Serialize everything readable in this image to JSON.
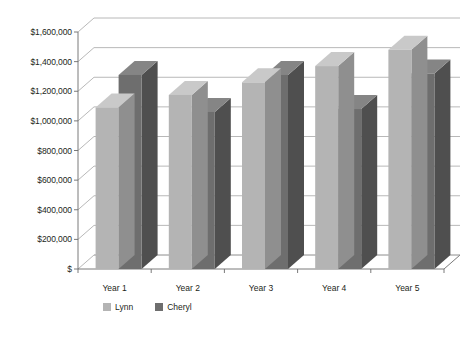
{
  "chart_data": {
    "type": "bar",
    "title": "",
    "subtitle": "",
    "xlabel": "",
    "ylabel": "",
    "categories": [
      "Year 1",
      "Year 2",
      "Year 3",
      "Year 4",
      "Year 5"
    ],
    "series": [
      {
        "name": "Lynn",
        "color": "#b4b4b4",
        "values": [
          1090000,
          1175000,
          1260000,
          1370000,
          1480000
        ]
      },
      {
        "name": "Cheryl",
        "color": "#6e6e6e",
        "values": [
          1310000,
          1060000,
          1310000,
          1080000,
          1320000
        ]
      }
    ],
    "ylim": [
      0,
      1600000
    ],
    "ytick_values": [
      0,
      200000,
      400000,
      600000,
      800000,
      1000000,
      1200000,
      1400000,
      1600000
    ],
    "ytick_labels": [
      "$",
      "$200,000",
      "$400,000",
      "$600,000",
      "$800,000",
      "$1,000,000",
      "$1,200,000",
      "$1,400,000",
      "$1,600,000"
    ],
    "grid": true,
    "grid_axis": "y",
    "legend": true,
    "legend_position": "bottom",
    "legend_entries": [
      "Lynn",
      "Cheryl"
    ],
    "style": "3d-column",
    "annotations": []
  },
  "colors": {
    "series_lynn": "#b4b4b4",
    "series_lynn_top": "#c9c9c9",
    "series_lynn_side": "#8f8f8f",
    "series_cheryl": "#6e6e6e",
    "series_cheryl_top": "#858585",
    "series_cheryl_side": "#4f4f4f",
    "gridline": "#a6a6a6",
    "axis": "#6b6b6b",
    "text": "#231f20",
    "background": "#ffffff"
  }
}
